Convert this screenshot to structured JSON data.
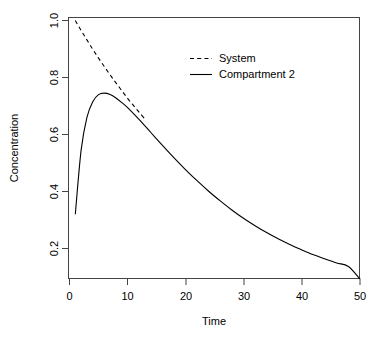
{
  "chart_data": {
    "type": "line",
    "title": "",
    "xlabel": "Time",
    "ylabel": "Concentration",
    "xlim": [
      0,
      50
    ],
    "ylim": [
      0.0,
      1.05
    ],
    "grid": false,
    "legend_position": "top-center-right",
    "xticks": [
      0,
      10,
      20,
      30,
      40,
      50
    ],
    "xtick_labels": [
      "0",
      "10",
      "20",
      "30",
      "40",
      "50"
    ],
    "yticks": [
      0.2,
      0.4,
      0.6,
      0.8,
      1.0
    ],
    "ytick_labels": [
      "0.2",
      "0.4",
      "0.6",
      "0.8",
      "1.0"
    ],
    "series": [
      {
        "name": "System",
        "style": "dashed",
        "color": "#000000",
        "x": [
          1,
          2,
          3,
          4,
          5,
          6,
          7,
          8,
          9,
          10,
          11,
          12,
          13
        ],
        "values": [
          1.0,
          0.965,
          0.932,
          0.899,
          0.868,
          0.838,
          0.809,
          0.781,
          0.754,
          0.727,
          0.702,
          0.678,
          0.654
        ]
      },
      {
        "name": "Compartment 2",
        "style": "solid",
        "color": "#000000",
        "x": [
          1,
          2,
          3,
          4,
          5,
          6,
          7,
          8,
          9,
          10,
          12,
          14,
          16,
          18,
          20,
          22,
          24,
          26,
          28,
          30,
          32,
          34,
          36,
          38,
          40,
          42,
          44,
          46,
          48,
          50
        ],
        "values": [
          0.32,
          0.545,
          0.66,
          0.715,
          0.74,
          0.745,
          0.74,
          0.728,
          0.712,
          0.694,
          0.652,
          0.607,
          0.562,
          0.518,
          0.476,
          0.437,
          0.4,
          0.366,
          0.334,
          0.305,
          0.279,
          0.255,
          0.233,
          0.213,
          0.195,
          0.178,
          0.163,
          0.149,
          0.137,
          0.093
        ]
      }
    ],
    "legend_entries": [
      {
        "label": "System",
        "style": "dashed"
      },
      {
        "label": "Compartment 2",
        "style": "solid"
      }
    ]
  },
  "axes": {
    "x_title": "Time",
    "y_title": "Concentration"
  }
}
